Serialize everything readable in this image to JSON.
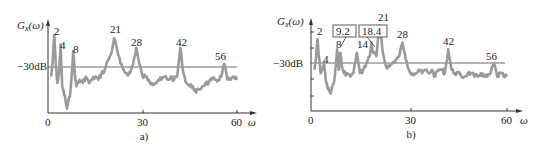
{
  "figure": {
    "panels": [
      {
        "caption": "a)",
        "ylabel": "G_x(ω)",
        "ylabel_main": "G",
        "ylabel_sub": "x",
        "ylabel_tail": "(ω)",
        "xlabel": "ω",
        "ref_label": "−30dB",
        "xticks": [
          "0",
          "30",
          "60"
        ],
        "peak_labels": [
          "2",
          "4",
          "8",
          "21",
          "28",
          "42",
          "56"
        ]
      },
      {
        "caption": "b)",
        "ylabel": "G_x(ω)",
        "ylabel_main": "G",
        "ylabel_sub": "x",
        "ylabel_tail": "(ω)",
        "xlabel": "ω",
        "ref_label": "−30dB",
        "xticks": [
          "0",
          "30",
          "60"
        ],
        "peak_labels": [
          "2",
          "4",
          "8",
          "14",
          "21",
          "28",
          "42",
          "56"
        ],
        "boxed_labels": [
          "9.2",
          "18.4"
        ]
      }
    ]
  },
  "chart_data": [
    {
      "type": "line",
      "title": "",
      "caption": "a)",
      "xlabel": "ω",
      "ylabel": "G_x(ω)",
      "xlim": [
        0,
        62
      ],
      "xticks": [
        0,
        30,
        60
      ],
      "reference_line": {
        "label": "−30dB",
        "relative_level": 0
      },
      "grid": false,
      "legend": null,
      "units_note": "y values relative to −30dB reference line, in arbitrary dB-like units (positive = above line)",
      "annotated_peaks": [
        {
          "x": 2,
          "label": "2",
          "y": 10
        },
        {
          "x": 4,
          "label": "4",
          "y": 7
        },
        {
          "x": 8,
          "label": "8",
          "y": 5
        },
        {
          "x": 21,
          "label": "21",
          "y": 9
        },
        {
          "x": 28,
          "label": "28",
          "y": 6
        },
        {
          "x": 42,
          "label": "42",
          "y": 6
        },
        {
          "x": 56,
          "label": "56",
          "y": 1
        }
      ],
      "x": [
        1,
        1.5,
        2,
        2.5,
        3,
        3.5,
        4,
        4.5,
        5,
        5.5,
        6,
        7,
        8,
        8.5,
        9,
        10,
        11,
        12,
        13,
        14,
        15,
        16,
        17,
        18,
        19,
        20,
        21,
        22,
        23,
        24,
        25,
        26,
        27,
        28,
        29,
        30,
        31,
        32,
        33,
        34,
        35,
        36,
        37,
        38,
        39,
        40,
        41,
        42,
        43,
        44,
        45,
        46,
        47,
        48,
        49,
        50,
        51,
        52,
        53,
        54,
        55,
        56,
        57,
        58,
        59,
        60
      ],
      "values": [
        -3,
        2,
        10,
        0,
        -5,
        -2,
        7,
        -6,
        -8,
        -10,
        -13,
        -9,
        5,
        -2,
        -6,
        -4,
        -5,
        -3,
        -5,
        -4,
        -3,
        -4,
        -2,
        -1,
        2,
        4,
        9,
        5,
        1,
        -1,
        -2,
        -2,
        1,
        6,
        1,
        -3,
        -3,
        -4,
        -5,
        -5,
        -4,
        -4,
        -3,
        -4,
        -3,
        -4,
        -3,
        6,
        -2,
        -5,
        -6,
        -6,
        -8,
        -7,
        -6,
        -5,
        -5,
        -4,
        -4,
        -4,
        -3,
        1,
        -4,
        -4,
        -3,
        -4
      ]
    },
    {
      "type": "line",
      "title": "",
      "caption": "b)",
      "xlabel": "ω",
      "ylabel": "G_x(ω)",
      "xlim": [
        0,
        62
      ],
      "xticks": [
        0,
        30,
        60
      ],
      "reference_line": {
        "label": "−30dB",
        "relative_level": 0
      },
      "grid": false,
      "legend": null,
      "units_note": "y values relative to −30dB reference line, in arbitrary dB-like units (positive = above line)",
      "annotated_peaks": [
        {
          "x": 2,
          "label": "2",
          "y": 7
        },
        {
          "x": 4,
          "label": "4",
          "y": 0
        },
        {
          "x": 8,
          "label": "8",
          "y": 4
        },
        {
          "x": 9.2,
          "label": "9.2",
          "boxed": true,
          "y": 3
        },
        {
          "x": 14,
          "label": "14",
          "y": 3
        },
        {
          "x": 18.4,
          "label": "18.4",
          "boxed": true,
          "y": 6
        },
        {
          "x": 21,
          "label": "21",
          "y": 11
        },
        {
          "x": 28,
          "label": "28",
          "y": 6
        },
        {
          "x": 42,
          "label": "42",
          "y": 4
        },
        {
          "x": 56,
          "label": "56",
          "y": 0
        }
      ],
      "x": [
        1,
        1.5,
        2,
        2.5,
        3,
        3.5,
        4,
        4.5,
        5,
        5.5,
        6,
        7,
        8,
        8.5,
        9,
        9.5,
        10,
        11,
        12,
        13,
        14,
        15,
        16,
        17,
        18,
        18.5,
        19,
        20,
        21,
        22,
        23,
        24,
        25,
        26,
        27,
        28,
        29,
        30,
        31,
        32,
        33,
        34,
        35,
        36,
        37,
        38,
        39,
        40,
        41,
        42,
        43,
        44,
        45,
        46,
        47,
        48,
        49,
        50,
        51,
        52,
        53,
        54,
        55,
        56,
        57,
        58,
        59,
        60
      ],
      "values": [
        -2,
        1,
        7,
        1,
        -3,
        -2,
        0,
        -5,
        -7,
        -8,
        -9,
        -6,
        4,
        -2,
        3,
        -1,
        -3,
        -3,
        -4,
        -3,
        3,
        -3,
        -2,
        0,
        2,
        6,
        3,
        2,
        11,
        3,
        -1,
        -1,
        0,
        1,
        2,
        6,
        1,
        -2,
        -3,
        -3,
        -2,
        -3,
        -2,
        -3,
        -2,
        -4,
        -2,
        -2,
        -3,
        4,
        -2,
        -3,
        -3,
        -4,
        -4,
        -3,
        -3,
        -4,
        -4,
        -3,
        -4,
        -4,
        -3,
        0,
        -4,
        -3,
        -4,
        -4
      ]
    }
  ]
}
